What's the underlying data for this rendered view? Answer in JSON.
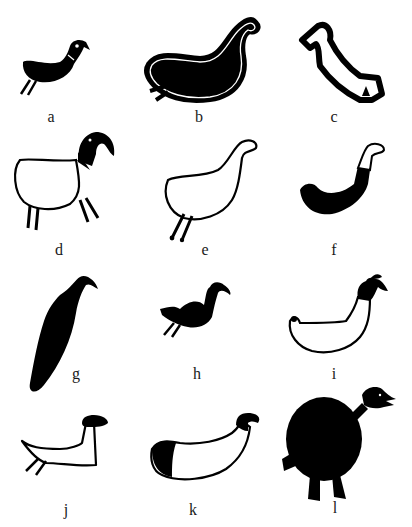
{
  "figure": {
    "panels": [
      {
        "label": "a",
        "description": "small black bird with white eye, two legs"
      },
      {
        "label": "b",
        "description": "large black bird with white outline"
      },
      {
        "label": "c",
        "description": "outlined bird, thick black outline"
      },
      {
        "label": "d",
        "description": "outlined body with black head, four legs"
      },
      {
        "label": "e",
        "description": "outlined bird with two legs"
      },
      {
        "label": "f",
        "description": "black crescent body with outlined neck and head"
      },
      {
        "label": "g",
        "description": "elongated black bird, vertical"
      },
      {
        "label": "h",
        "description": "small black bird with crest"
      },
      {
        "label": "i",
        "description": "outlined boat-shaped body with black crested head"
      },
      {
        "label": "j",
        "description": "outlined body with black head, two legs"
      },
      {
        "label": "k",
        "description": "outlined body with black rear and black head"
      },
      {
        "label": "l",
        "description": "round black bird with legs and beaked head"
      }
    ]
  },
  "colors": {
    "ink": "#000000",
    "paper": "#ffffff",
    "label": "#1a1a1a"
  }
}
